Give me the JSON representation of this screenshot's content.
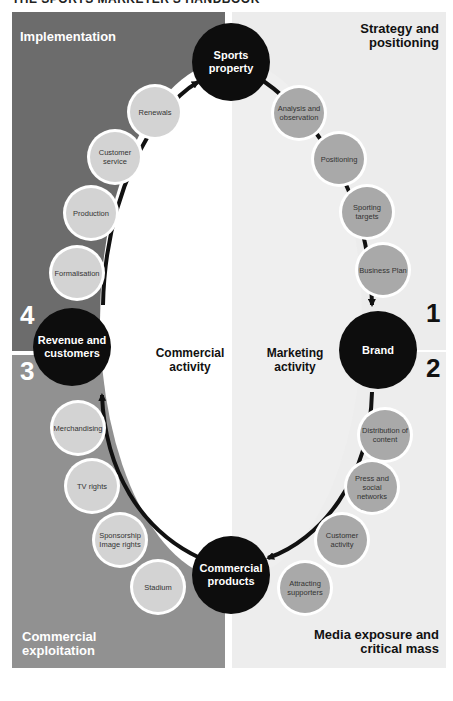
{
  "header": {
    "title": "THE SPORTS MARKETER'S HANDBOOK"
  },
  "quadrants": {
    "top_left": {
      "title": "Implementation",
      "number": "4",
      "color": "#6c6c6c"
    },
    "top_right": {
      "title": "Strategy and positioning",
      "number": "1",
      "color": "#ececec"
    },
    "bottom_right": {
      "title": "Media exposure and critical mass",
      "number": "2",
      "color": "#ededed"
    },
    "bottom_left": {
      "title": "Commercial exploitation",
      "number": "3",
      "color": "#919191"
    }
  },
  "hubs": {
    "sports_property": "Sports property",
    "brand": "Brand",
    "commercial_products": "Commercial products",
    "revenue_customers": "Revenue and customers"
  },
  "activities": {
    "marketing": "Marketing activity",
    "commercial": "Commercial activity"
  },
  "steps": {
    "strategy": [
      "Analysis and observation",
      "Positioning",
      "Sporting targets",
      "Business Plan"
    ],
    "media": [
      "Distribution of content",
      "Press and social networks",
      "Customer activity",
      "Attracting supporters"
    ],
    "exploitation": [
      "Stadium",
      "Sponsorship Image rights",
      "TV rights",
      "Merchandising"
    ],
    "implementation": [
      "Formalisation",
      "Production",
      "Customer service",
      "Renewals"
    ]
  },
  "colors": {
    "hub": "#0d0d0d",
    "left_step": "#d3d3d3",
    "right_step": "#a9a9a9",
    "arrow": "#111111"
  }
}
